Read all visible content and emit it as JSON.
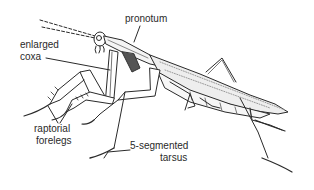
{
  "diagram": {
    "labels": {
      "pronotum": "pronotum",
      "enlarged_coxa_line1": "enlarged",
      "enlarged_coxa_line2": "coxa",
      "raptorial_forelegs_line1": "raptorial",
      "raptorial_forelegs_line2": "forelegs",
      "tarsus_line1": "5-segmented",
      "tarsus_line2": "tarsus"
    },
    "colors": {
      "ink": "#2a2a2a",
      "background": "#ffffff",
      "shading": "#bbbbbb"
    }
  }
}
